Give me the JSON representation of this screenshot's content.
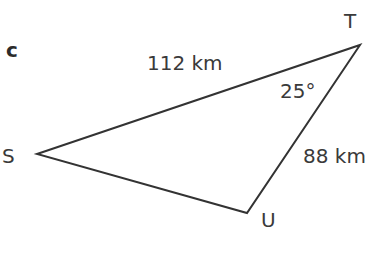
{
  "part_label": "c",
  "vertices": {
    "T": {
      "label": "T",
      "x": 360,
      "y": 45
    },
    "S": {
      "label": "S",
      "x": 37,
      "y": 154
    },
    "U": {
      "label": "U",
      "x": 247,
      "y": 213
    }
  },
  "sides": {
    "ST": "112 km",
    "TU": "88 km"
  },
  "angles": {
    "T": "25°"
  },
  "colors": {
    "line": "#333333",
    "text": "#3a3a3a"
  }
}
